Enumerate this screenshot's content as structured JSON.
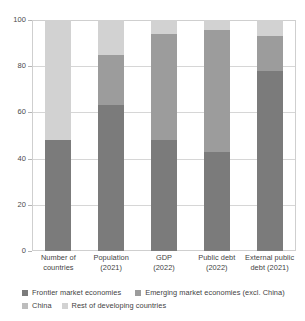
{
  "chart_data": {
    "type": "bar",
    "title": "",
    "subtitle": "",
    "xlabel": "",
    "ylabel": "",
    "stacked": true,
    "stack_mode": "percent",
    "ylim": [
      0,
      100
    ],
    "yticks": [
      0,
      20,
      40,
      60,
      80,
      100
    ],
    "ytick_labels": [
      "0",
      "20",
      "40",
      "60",
      "80",
      "100"
    ],
    "grid": true,
    "grid_axis": "y",
    "legend_position": "bottom-left",
    "categories": [
      "Number of countries",
      "Population (2021)",
      "GDP (2022)",
      "Public debt (2022)",
      "External public debt (2021)"
    ],
    "category_lines": [
      [
        "Number of",
        "countries"
      ],
      [
        "Population",
        "(2021)"
      ],
      [
        "GDP",
        "(2022)"
      ],
      [
        "Public debt",
        "(2022)"
      ],
      [
        "External public",
        "debt (2021)"
      ]
    ],
    "series": [
      {
        "name": "Frontier market economies",
        "color": "#7b7b7b",
        "values": [
          48,
          63,
          48,
          43,
          78
        ]
      },
      {
        "name": "Emerging market economies (excl. China)",
        "color": "#9c9c9c",
        "values": [
          0,
          22,
          46,
          52.5,
          15
        ]
      },
      {
        "name": "China",
        "color": "#bdbdbd",
        "values": [
          0,
          0,
          0,
          0,
          0
        ]
      },
      {
        "name": "Rest of developing countries",
        "color": "#d2d2d2",
        "values": [
          52,
          15,
          6,
          4.5,
          7
        ]
      }
    ]
  },
  "legend": {
    "items": [
      {
        "label": "Frontier market economies",
        "color": "#7b7b7b"
      },
      {
        "label": "Emerging market economies (excl. China)",
        "color": "#9c9c9c"
      },
      {
        "label": "China",
        "color": "#bdbdbd"
      },
      {
        "label": "Rest of developing countries",
        "color": "#d2d2d2"
      }
    ]
  }
}
